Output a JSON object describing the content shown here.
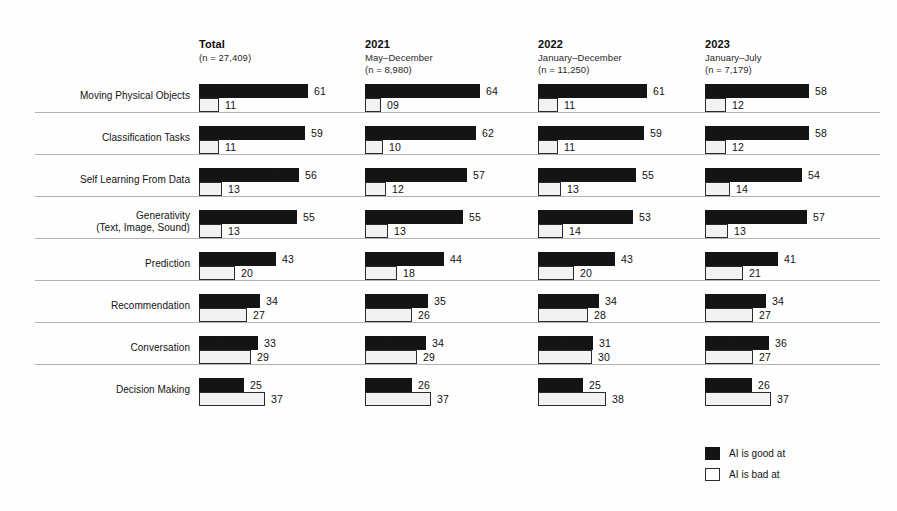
{
  "chart_data": {
    "type": "bar",
    "title": "",
    "subtitle": "",
    "xlabel": "",
    "ylabel": "",
    "xlim": [
      0,
      100
    ],
    "grid": false,
    "orientation": "horizontal",
    "layout": "small-multiples-4-columns",
    "legend_position": "bottom-right",
    "categories": [
      "Moving Physical Objects",
      "Classification Tasks",
      "Self Learning From Data",
      "Generativity\n(Text, Image, Sound)",
      "Prediction",
      "Recommendation",
      "Conversation",
      "Decision Making"
    ],
    "panels": [
      {
        "year": "Total",
        "period": "",
        "n": "(n = 27,409)",
        "series": [
          {
            "name": "AI is good at",
            "values": [
              61,
              59,
              56,
              55,
              43,
              34,
              33,
              25
            ],
            "labels": [
              "61",
              "59",
              "56",
              "55",
              "43",
              "34",
              "33",
              "25"
            ]
          },
          {
            "name": "AI is bad at",
            "values": [
              11,
              11,
              13,
              13,
              20,
              27,
              29,
              37
            ],
            "labels": [
              "11",
              "11",
              "13",
              "13",
              "20",
              "27",
              "29",
              "37"
            ]
          }
        ]
      },
      {
        "year": "2021",
        "period": "May–December",
        "n": "(n = 8,980)",
        "series": [
          {
            "name": "AI is good at",
            "values": [
              64,
              62,
              57,
              55,
              44,
              35,
              34,
              26
            ],
            "labels": [
              "64",
              "62",
              "57",
              "55",
              "44",
              "35",
              "34",
              "26"
            ]
          },
          {
            "name": "AI is bad at",
            "values": [
              9,
              10,
              12,
              13,
              18,
              26,
              29,
              37
            ],
            "labels": [
              "09",
              "10",
              "12",
              "13",
              "18",
              "26",
              "29",
              "37"
            ]
          }
        ]
      },
      {
        "year": "2022",
        "period": "January–December",
        "n": "(n = 11,250)",
        "series": [
          {
            "name": "AI is good at",
            "values": [
              61,
              59,
              55,
              53,
              43,
              34,
              31,
              25
            ],
            "labels": [
              "61",
              "59",
              "55",
              "53",
              "43",
              "34",
              "31",
              "25"
            ]
          },
          {
            "name": "AI is bad at",
            "values": [
              11,
              11,
              13,
              14,
              20,
              28,
              30,
              38
            ],
            "labels": [
              "11",
              "11",
              "13",
              "14",
              "20",
              "28",
              "30",
              "38"
            ]
          }
        ]
      },
      {
        "year": "2023",
        "period": "January–July",
        "n": "(n = 7,179)",
        "series": [
          {
            "name": "AI is good at",
            "values": [
              58,
              58,
              54,
              57,
              41,
              34,
              36,
              26
            ],
            "labels": [
              "58",
              "58",
              "54",
              "57",
              "41",
              "34",
              "36",
              "26"
            ]
          },
          {
            "name": "AI is bad at",
            "values": [
              12,
              12,
              14,
              13,
              21,
              27,
              27,
              37
            ],
            "labels": [
              "12",
              "12",
              "14",
              "13",
              "21",
              "27",
              "27",
              "37"
            ]
          }
        ]
      }
    ],
    "legend": [
      {
        "key": "good",
        "label": "AI is good at",
        "color": "#141414"
      },
      {
        "key": "bad",
        "label": "AI is bad at",
        "color": "#f2f2f2"
      }
    ]
  },
  "render": {
    "column_x": [
      199,
      365,
      538,
      705
    ],
    "row_top": [
      84,
      126,
      168,
      210,
      252,
      294,
      336,
      378
    ],
    "px_per_unit": 1.79
  }
}
